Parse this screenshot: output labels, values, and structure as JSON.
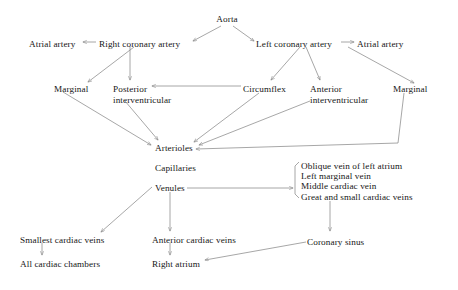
{
  "diagram": {
    "stroke_color": "#8a8a8a",
    "text_color": "#161616",
    "background": "#ffffff",
    "nodes": [
      {
        "id": "aorta",
        "label": "Aorta",
        "x": 227,
        "y": 14,
        "align": "center"
      },
      {
        "id": "atrial-left",
        "label": "Atrial artery",
        "x": 29,
        "y": 39,
        "align": "left"
      },
      {
        "id": "right-coronary",
        "label": "Right coronary artery",
        "x": 99,
        "y": 39,
        "align": "left"
      },
      {
        "id": "left-coronary",
        "label": "Left coronary artery",
        "x": 256,
        "y": 39,
        "align": "left"
      },
      {
        "id": "atrial-right",
        "label": "Atrial artery",
        "x": 357,
        "y": 39,
        "align": "left"
      },
      {
        "id": "marginal-left",
        "label": "Marginal",
        "x": 54,
        "y": 84,
        "align": "left"
      },
      {
        "id": "posterior-iv",
        "label": "Posterior",
        "label2": "interventricular",
        "x": 113,
        "y": 84,
        "align": "left"
      },
      {
        "id": "circumflex",
        "label": "Circumflex",
        "x": 243,
        "y": 84,
        "align": "left"
      },
      {
        "id": "anterior-iv",
        "label": "Anterior",
        "label2": "interventricular",
        "x": 310,
        "y": 84,
        "align": "left"
      },
      {
        "id": "marginal-right",
        "label": "Marginal",
        "x": 393,
        "y": 84,
        "align": "left"
      },
      {
        "id": "arterioles",
        "label": "Arterioles",
        "x": 155,
        "y": 143,
        "align": "left"
      },
      {
        "id": "capillaries",
        "label": "Capillaries",
        "x": 155,
        "y": 163,
        "align": "left"
      },
      {
        "id": "venules",
        "label": "Venules",
        "x": 155,
        "y": 183,
        "align": "left"
      },
      {
        "id": "smallest-cardiac",
        "label": "Smallest cardiac veins",
        "x": 20,
        "y": 235,
        "align": "left"
      },
      {
        "id": "all-chambers",
        "label": "All cardiac chambers",
        "x": 20,
        "y": 259,
        "align": "left"
      },
      {
        "id": "anterior-cardiac",
        "label": "Anterior cardiac veins",
        "x": 152,
        "y": 235,
        "align": "left"
      },
      {
        "id": "right-atrium",
        "label": "Right atrium",
        "x": 152,
        "y": 259,
        "align": "left"
      },
      {
        "id": "coronary-sinus",
        "label": "Coronary sinus",
        "x": 307,
        "y": 237,
        "align": "left"
      }
    ],
    "vein_list": {
      "id": "vein-list",
      "x": 301,
      "y": 161,
      "items": [
        "Oblique vein of left atrium",
        "Left marginal vein",
        "Middle cardiac vein",
        "Great and small cardiac veins"
      ]
    }
  }
}
